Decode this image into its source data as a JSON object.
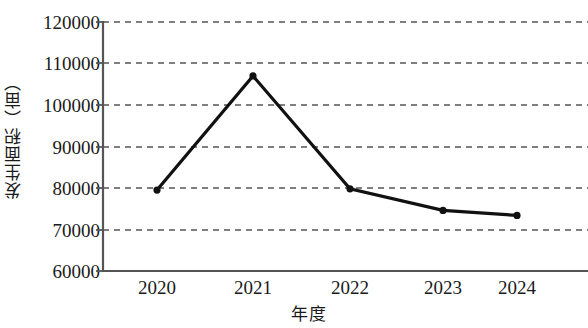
{
  "chart_data": {
    "type": "line",
    "title": "",
    "xlabel": "年度",
    "ylabel": "发生面积（亩）",
    "categories": [
      "2020",
      "2021",
      "2022",
      "2023",
      "2024"
    ],
    "values": [
      79500,
      107000,
      79800,
      74600,
      73400
    ],
    "series": [
      {
        "name": "发生面积",
        "values": [
          79500,
          107000,
          79800,
          74600,
          73400
        ]
      }
    ],
    "ylim": [
      60000,
      120000
    ],
    "ytick_labels": [
      "120000",
      "110000",
      "100000",
      "90000",
      "80000",
      "70000",
      "60000"
    ],
    "ytick_values": [
      120000,
      110000,
      100000,
      90000,
      80000,
      70000,
      60000
    ],
    "xtick_labels": [
      "2020",
      "2021",
      "2022",
      "2023",
      "2024"
    ],
    "grid": "horizontal-dashed",
    "legend": "none",
    "line_color": "#111111",
    "grid_color": "#555555",
    "axis_color": "#555555",
    "marker": "circle"
  }
}
